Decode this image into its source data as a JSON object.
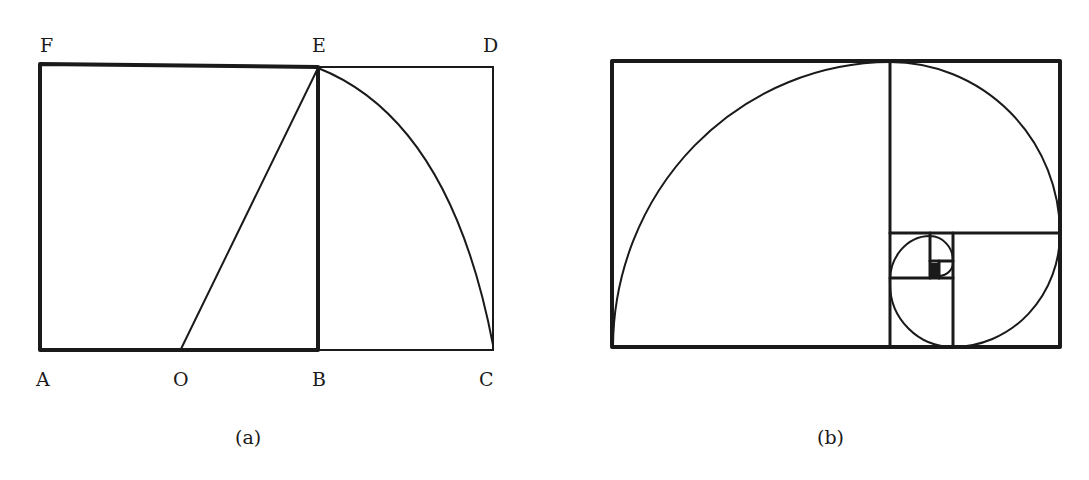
{
  "figure_a": {
    "caption": "(a)",
    "points": {
      "A": "A",
      "O": "O",
      "B": "B",
      "C": "C",
      "D": "D",
      "E": "E",
      "F": "F"
    }
  },
  "figure_b": {
    "caption": "(b)"
  },
  "colors": {
    "ink": "#1a1a1a",
    "background": "#ffffff"
  }
}
